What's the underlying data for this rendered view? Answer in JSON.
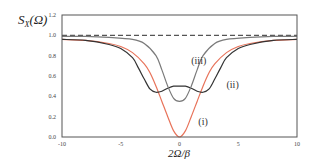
{
  "chart_data": {
    "type": "line",
    "title": "",
    "xlabel": "2Ω/β",
    "ylabel": "S_X(Ω)",
    "ylabel_main": "S",
    "ylabel_sub": "X",
    "ylabel_arg": "(Ω)",
    "xlim": [
      -10,
      10
    ],
    "ylim": [
      0,
      1.2
    ],
    "xticks": [
      -10,
      -5,
      0,
      5,
      10
    ],
    "xtick_labels": [
      "-10",
      "-5",
      "0",
      "5",
      "10"
    ],
    "yticks": [
      0.0,
      0.2,
      0.4,
      0.6,
      0.8,
      1.0,
      1.2
    ],
    "ytick_labels": [
      "0.0",
      "0.2",
      "0.4",
      "0.6",
      "0.8",
      "1.0",
      "1.2"
    ],
    "grid": false,
    "legend": "none (inline curve labels)",
    "reference_line": {
      "y": 1.0,
      "style": "dashed",
      "color": "#555555"
    },
    "series": [
      {
        "name": "(i)",
        "color": "#e8735a",
        "x": [
          -10,
          -8,
          -6,
          -5,
          -4,
          -3,
          -2.5,
          -2,
          -1.5,
          -1,
          -0.5,
          0,
          0.5,
          1,
          1.5,
          2,
          2.5,
          3,
          4,
          5,
          6,
          8,
          10
        ],
        "y": [
          0.96,
          0.95,
          0.92,
          0.89,
          0.83,
          0.72,
          0.63,
          0.5,
          0.35,
          0.2,
          0.06,
          0.0,
          0.06,
          0.2,
          0.35,
          0.5,
          0.63,
          0.72,
          0.83,
          0.89,
          0.92,
          0.95,
          0.96
        ]
      },
      {
        "name": "(ii)",
        "color": "#333333",
        "x": [
          -10,
          -8,
          -6,
          -5,
          -4,
          -3.5,
          -3,
          -2.5,
          -2,
          -1.5,
          -1,
          -0.5,
          0,
          0.5,
          1,
          1.5,
          2,
          2.5,
          3,
          3.5,
          4,
          5,
          6,
          8,
          10
        ],
        "y": [
          0.96,
          0.95,
          0.91,
          0.87,
          0.78,
          0.68,
          0.57,
          0.47,
          0.44,
          0.45,
          0.48,
          0.5,
          0.5,
          0.5,
          0.48,
          0.45,
          0.44,
          0.47,
          0.57,
          0.68,
          0.78,
          0.87,
          0.91,
          0.95,
          0.96
        ]
      },
      {
        "name": "(iii)",
        "color": "#7a7a7a",
        "x": [
          -10,
          -8,
          -6,
          -4,
          -3,
          -2,
          -1.5,
          -1,
          -0.5,
          0,
          0.5,
          1,
          1.5,
          2,
          3,
          4,
          6,
          8,
          10
        ],
        "y": [
          0.99,
          0.99,
          0.98,
          0.96,
          0.92,
          0.8,
          0.66,
          0.5,
          0.38,
          0.35,
          0.38,
          0.5,
          0.66,
          0.8,
          0.92,
          0.96,
          0.98,
          0.99,
          0.99
        ]
      }
    ],
    "annotations": [
      {
        "text": "(i)",
        "x": 1.6,
        "y": 0.12
      },
      {
        "text": "(ii)",
        "x": 4.0,
        "y": 0.48
      },
      {
        "text": "(iii)",
        "x": 1.0,
        "y": 0.72
      }
    ]
  }
}
